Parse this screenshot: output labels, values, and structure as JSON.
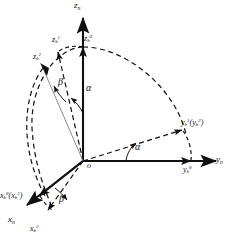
{
  "figure": {
    "type": "diagram",
    "origin_label": "o",
    "colors": {
      "stroke": "#111111",
      "thin_line": "#8a8a8a",
      "background": "#ffffff"
    }
  },
  "axes": {
    "z_n": {
      "base": "z",
      "sub": "n",
      "sup": ""
    },
    "y_n": {
      "base": "y",
      "sub": "n",
      "sup": ""
    },
    "x_n": {
      "base": "x",
      "sub": "n",
      "sup": ""
    }
  },
  "labels": {
    "z_n": {
      "base": "z",
      "sub": "n",
      "sup": "",
      "text": "zn"
    },
    "z_b0": {
      "base": "z",
      "sub": "b",
      "sup": "0",
      "text": "zb0"
    },
    "z_b1": {
      "base": "z",
      "sub": "b",
      "sup": "1",
      "text": "zb1"
    },
    "z_b2": {
      "base": "z",
      "sub": "b",
      "sup": "2",
      "text": "zb2"
    },
    "y_n": {
      "base": "y",
      "sub": "n",
      "sup": "",
      "text": "yn"
    },
    "y_b0": {
      "base": "y",
      "sub": "b",
      "sup": "0",
      "text": "yb0"
    },
    "y_b1_y_b2": {
      "base": "y",
      "sub": "b",
      "sup": "1",
      "paren_base": "y",
      "paren_sub": "b",
      "paren_sup": "2",
      "text": "yb1(yb2)"
    },
    "x_n": {
      "base": "x",
      "sub": "n",
      "sup": "",
      "text": "xn"
    },
    "x_b0_x_b1": {
      "base": "x",
      "sub": "b",
      "sup": "0",
      "paren_base": "x",
      "paren_sub": "b",
      "paren_sup": "1",
      "text": "xb0(xb1)"
    },
    "x_b2": {
      "base": "x",
      "sub": "b",
      "sup": "2",
      "text": "xb2"
    },
    "origin": {
      "text": "o"
    }
  },
  "angles": {
    "alpha_vertical": {
      "symbol": "α"
    },
    "alpha_horizontal": {
      "symbol": "α"
    },
    "beta_upper": {
      "symbol": "β"
    },
    "beta_lower": {
      "symbol": "β"
    }
  }
}
